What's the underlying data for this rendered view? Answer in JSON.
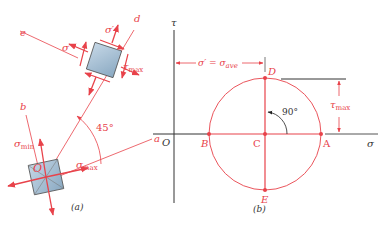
{
  "colors": {
    "accent": "#e8424a",
    "axis": "#333333",
    "element_fill": "#a9c4d8",
    "element_stroke": "#555555"
  },
  "panel_a": {
    "caption": "(a)",
    "element_origin_label": "O",
    "axis_labels": {
      "a": "a",
      "b": "b",
      "d": "d",
      "e": "e"
    },
    "stress_labels": {
      "sigma_min": "σ",
      "sigma_min_sub": "min",
      "sigma_max": "σ",
      "sigma_max_sub": "max",
      "sigma_prime_1": "σ′",
      "sigma_prime_2": "σ′",
      "tau_max": "τ",
      "tau_max_sub": "max"
    },
    "angle_label": "45°"
  },
  "panel_b": {
    "caption": "(b)",
    "tau_axis_label": "τ",
    "sigma_axis_label": "σ",
    "origin_label": "O",
    "points": {
      "A": "A",
      "B": "B",
      "C": "C",
      "D": "D",
      "E": "E"
    },
    "dimension_label": "σ′ = σ",
    "dimension_label_sub": "ave",
    "tau_max_label": "τ",
    "tau_max_sub": "max",
    "angle_label": "90°"
  }
}
